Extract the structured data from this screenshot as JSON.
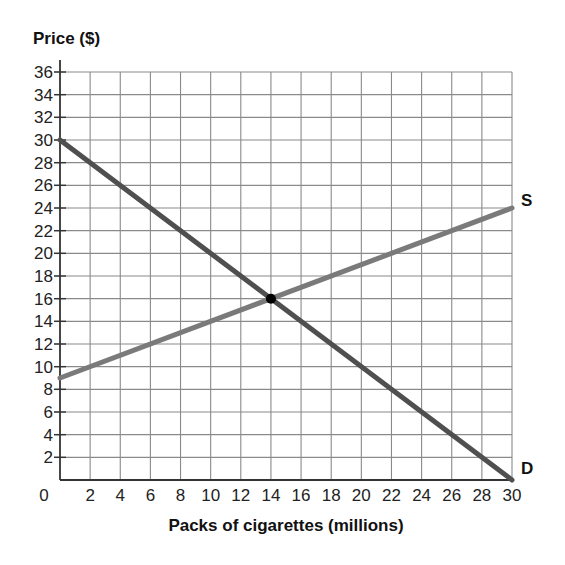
{
  "chart_data": {
    "type": "line",
    "title": "",
    "xlabel": "Packs of cigarettes (millions)",
    "ylabel": "Price ($)",
    "xlim": [
      0,
      30
    ],
    "ylim": [
      0,
      36
    ],
    "x_ticks": [
      0,
      2,
      4,
      6,
      8,
      10,
      12,
      14,
      16,
      18,
      20,
      22,
      24,
      26,
      28,
      30
    ],
    "y_ticks": [
      2,
      4,
      6,
      8,
      10,
      12,
      14,
      16,
      18,
      20,
      22,
      24,
      26,
      28,
      30,
      32,
      34,
      36
    ],
    "grid": true,
    "series": [
      {
        "name": "S",
        "label": "S",
        "color": "#7a7a7a",
        "x": [
          0,
          30
        ],
        "y": [
          9,
          24
        ]
      },
      {
        "name": "D",
        "label": "D",
        "color": "#4f4f4f",
        "x": [
          0,
          30
        ],
        "y": [
          30,
          0
        ]
      }
    ],
    "annotations": [
      {
        "type": "point",
        "label": "equilibrium",
        "x": 14,
        "y": 16,
        "color": "#000000"
      }
    ],
    "legend": "inline labels at line ends"
  }
}
